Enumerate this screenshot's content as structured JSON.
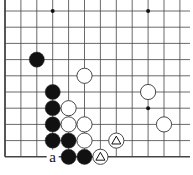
{
  "diagram": {
    "type": "go-board-fragment",
    "edges": [
      "left",
      "bottom"
    ],
    "columns": 12,
    "rows": 10,
    "origin_x": 5,
    "origin_y": 11,
    "spacing_x": 15.9,
    "spacing_y": 16.2,
    "star_points": [
      [
        3,
        0
      ],
      [
        9,
        0
      ],
      [
        9,
        6
      ]
    ],
    "stones": [
      {
        "color": "black",
        "col": 2,
        "row": 3
      },
      {
        "color": "white",
        "col": 5,
        "row": 4
      },
      {
        "color": "black",
        "col": 3,
        "row": 5
      },
      {
        "color": "white",
        "col": 9,
        "row": 5
      },
      {
        "color": "black",
        "col": 3,
        "row": 6
      },
      {
        "color": "white",
        "col": 4,
        "row": 6
      },
      {
        "color": "black",
        "col": 3,
        "row": 7
      },
      {
        "color": "white",
        "col": 4,
        "row": 7
      },
      {
        "color": "white",
        "col": 5,
        "row": 7
      },
      {
        "color": "white",
        "col": 10,
        "row": 7
      },
      {
        "color": "black",
        "col": 3,
        "row": 8
      },
      {
        "color": "black",
        "col": 4,
        "row": 8
      },
      {
        "color": "white",
        "col": 5,
        "row": 8
      },
      {
        "color": "white",
        "col": 7,
        "row": 8,
        "mark": "triangle"
      },
      {
        "color": "black",
        "col": 4,
        "row": 9
      },
      {
        "color": "black",
        "col": 5,
        "row": 9
      },
      {
        "color": "white",
        "col": 6,
        "row": 9,
        "mark": "triangle"
      }
    ],
    "labels": [
      {
        "text": "a",
        "col": 3,
        "row": 9
      }
    ],
    "colors": {
      "line": "#444444",
      "edge": "#222222",
      "black_stone": "#111111",
      "white_stone": "#ffffff",
      "stone_outline": "#333333"
    }
  }
}
